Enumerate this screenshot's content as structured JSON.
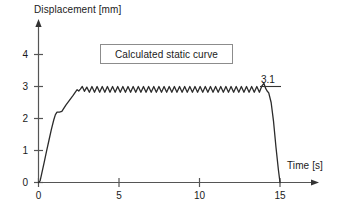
{
  "chart_data": {
    "type": "line",
    "title": "",
    "xlabel": "Time [s]",
    "ylabel": "Displacement [mm]",
    "xlim": [
      0,
      16.8
    ],
    "ylim": [
      0,
      4.6
    ],
    "xticks": [
      0,
      5,
      10,
      15
    ],
    "xtick_labels": [
      "0",
      "5",
      "10",
      "15"
    ],
    "yticks": [
      0,
      1,
      2,
      3,
      4
    ],
    "ytick_labels": [
      "0",
      "1",
      "2",
      "3",
      "4"
    ],
    "grid": false,
    "legend": null,
    "annotations": [
      {
        "name": "legend-box",
        "text": "Calculated static curve",
        "x": 7.8,
        "y": 4.15
      },
      {
        "name": "peak-value",
        "text": "3.1",
        "x": 14.1,
        "y": 3.35,
        "underline": true
      }
    ],
    "series": [
      {
        "name": "Calculated static curve",
        "color": "#2b2b2b",
        "description": "Rapid rise from 0 to ~2.2 mm by t=1.2 s, shoulder, climb to ~2.9 mm at t=2.6 s, sustained oscillation about 2.9 mm (amplitude ~0.12 mm, period ~0.62 s) until t=14.2 s, then fast drop to 0 at t=15 s.",
        "points": [
          [
            0.0,
            0.0
          ],
          [
            0.1,
            0.05
          ],
          [
            0.2,
            0.28
          ],
          [
            0.35,
            0.62
          ],
          [
            0.5,
            0.98
          ],
          [
            0.65,
            1.32
          ],
          [
            0.8,
            1.66
          ],
          [
            0.95,
            1.96
          ],
          [
            1.05,
            2.12
          ],
          [
            1.15,
            2.2
          ],
          [
            1.3,
            2.2
          ],
          [
            1.45,
            2.22
          ],
          [
            1.55,
            2.3
          ],
          [
            1.7,
            2.42
          ],
          [
            1.85,
            2.52
          ],
          [
            2.0,
            2.62
          ],
          [
            2.15,
            2.72
          ],
          [
            2.3,
            2.83
          ],
          [
            2.4,
            2.9
          ],
          [
            2.5,
            2.86
          ],
          [
            2.6,
            2.92
          ],
          [
            2.72,
            3.0
          ],
          [
            2.85,
            2.85
          ],
          [
            3.0,
            2.98
          ],
          [
            3.16,
            2.82
          ],
          [
            3.32,
            3.0
          ],
          [
            3.48,
            2.82
          ],
          [
            3.64,
            3.0
          ],
          [
            3.8,
            2.82
          ],
          [
            3.96,
            3.0
          ],
          [
            4.12,
            2.82
          ],
          [
            4.28,
            3.0
          ],
          [
            4.44,
            2.82
          ],
          [
            4.6,
            3.0
          ],
          [
            4.76,
            2.82
          ],
          [
            4.92,
            3.0
          ],
          [
            5.08,
            2.82
          ],
          [
            5.24,
            3.0
          ],
          [
            5.4,
            2.82
          ],
          [
            5.56,
            3.0
          ],
          [
            5.72,
            2.82
          ],
          [
            5.88,
            3.0
          ],
          [
            6.04,
            2.82
          ],
          [
            6.2,
            3.0
          ],
          [
            6.36,
            2.82
          ],
          [
            6.52,
            3.0
          ],
          [
            6.68,
            2.82
          ],
          [
            6.84,
            3.0
          ],
          [
            7.0,
            2.82
          ],
          [
            7.16,
            3.0
          ],
          [
            7.32,
            2.82
          ],
          [
            7.48,
            3.0
          ],
          [
            7.64,
            2.82
          ],
          [
            7.8,
            3.0
          ],
          [
            7.96,
            2.82
          ],
          [
            8.12,
            3.0
          ],
          [
            8.28,
            2.82
          ],
          [
            8.44,
            3.0
          ],
          [
            8.6,
            2.82
          ],
          [
            8.76,
            3.0
          ],
          [
            8.92,
            2.82
          ],
          [
            9.08,
            3.0
          ],
          [
            9.24,
            2.82
          ],
          [
            9.4,
            3.0
          ],
          [
            9.56,
            2.82
          ],
          [
            9.72,
            3.0
          ],
          [
            9.88,
            2.82
          ],
          [
            10.04,
            3.0
          ],
          [
            10.2,
            2.82
          ],
          [
            10.36,
            3.0
          ],
          [
            10.52,
            2.82
          ],
          [
            10.68,
            3.0
          ],
          [
            10.84,
            2.82
          ],
          [
            11.0,
            3.0
          ],
          [
            11.16,
            2.82
          ],
          [
            11.32,
            3.0
          ],
          [
            11.48,
            2.82
          ],
          [
            11.64,
            3.0
          ],
          [
            11.8,
            2.82
          ],
          [
            11.96,
            3.0
          ],
          [
            12.12,
            2.82
          ],
          [
            12.28,
            3.0
          ],
          [
            12.44,
            2.82
          ],
          [
            12.6,
            3.0
          ],
          [
            12.76,
            2.82
          ],
          [
            12.92,
            3.0
          ],
          [
            13.08,
            2.82
          ],
          [
            13.24,
            3.0
          ],
          [
            13.4,
            2.82
          ],
          [
            13.56,
            3.0
          ],
          [
            13.72,
            2.82
          ],
          [
            13.88,
            3.02
          ],
          [
            14.0,
            3.1
          ],
          [
            14.1,
            2.95
          ],
          [
            14.2,
            2.86
          ],
          [
            14.3,
            2.8
          ],
          [
            14.45,
            2.5
          ],
          [
            14.6,
            1.9
          ],
          [
            14.75,
            1.1
          ],
          [
            14.9,
            0.4
          ],
          [
            15.0,
            0.0
          ]
        ]
      }
    ]
  }
}
